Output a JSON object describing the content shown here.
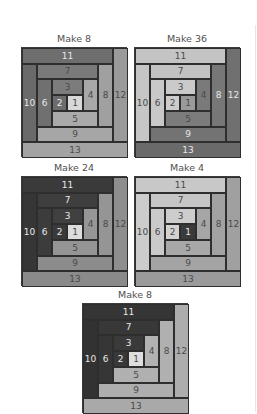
{
  "blocks": [
    {
      "id": "A",
      "title": "Make 8",
      "x": 21,
      "y": 33,
      "colors": {
        "1": "#d8d8d8",
        "2": "#6c6c6c",
        "3": "#7c7c7c",
        "4": "#a8a8a8",
        "5": "#aaaaaa",
        "6": "#707070",
        "7": "#7a7a7a",
        "8": "#a0a0a0",
        "9": "#a6a6a6",
        "10": "#6a6a6a",
        "11": "#6e6e6e",
        "12": "#9a9a9a",
        "13": "#a3a3a3"
      }
    },
    {
      "id": "B",
      "title": "Make 36",
      "x": 134,
      "y": 33,
      "colors": {
        "1": "#9a9a9a",
        "2": "#cccccc",
        "3": "#cacaca",
        "4": "#7a7a7a",
        "5": "#7c7c7c",
        "6": "#c8c8c8",
        "7": "#c2c2c2",
        "8": "#777777",
        "9": "#737373",
        "10": "#c6c6c6",
        "11": "#c4c4c4",
        "12": "#707070",
        "13": "#6a6a6a"
      }
    },
    {
      "id": "C",
      "title": "Make 24",
      "x": 21,
      "y": 162,
      "colors": {
        "1": "#dcdcdc",
        "2": "#3a3a3a",
        "3": "#404040",
        "4": "#969696",
        "5": "#959595",
        "6": "#3c3c3c",
        "7": "#3e3e3e",
        "8": "#959595",
        "9": "#8c8c8c",
        "10": "#363636",
        "11": "#3a3a3a",
        "12": "#8e8e8e",
        "13": "#8a8a8a"
      }
    },
    {
      "id": "D",
      "title": "Make 4",
      "x": 134,
      "y": 162,
      "colors": {
        "1": "#3a3a3a",
        "2": "#d2d2d2",
        "3": "#cdcdcd",
        "4": "#a6a6a6",
        "5": "#a8a8a8",
        "6": "#cacaca",
        "7": "#c6c6c6",
        "8": "#a2a2a2",
        "9": "#a4a4a4",
        "10": "#cccccc",
        "11": "#c8c8c8",
        "12": "#a0a0a0",
        "13": "#9a9a9a"
      }
    },
    {
      "id": "E",
      "title": "Make 8",
      "x": 82,
      "y": 289,
      "colors": {
        "1": "#dedede",
        "2": "#383838",
        "3": "#3a3a3a",
        "4": "#b2b2b2",
        "5": "#b0b0b0",
        "6": "#363636",
        "7": "#383838",
        "8": "#b0b0b0",
        "9": "#aeaeae",
        "10": "#323232",
        "11": "#353535",
        "12": "#adadad",
        "13": "#a9a9a9"
      }
    }
  ],
  "strip_labels": [
    "1",
    "2",
    "3",
    "4",
    "5",
    "6",
    "7",
    "8",
    "9",
    "10",
    "11",
    "12",
    "13"
  ],
  "layout_units": {
    "1": [
      3,
      3,
      1,
      1
    ],
    "2": [
      2,
      3,
      1,
      1
    ],
    "3": [
      2,
      2,
      2,
      1
    ],
    "4": [
      4,
      2,
      1,
      2
    ],
    "5": [
      2,
      4,
      3,
      1
    ],
    "6": [
      1,
      2,
      1,
      3
    ],
    "7": [
      1,
      1,
      4,
      1
    ],
    "8": [
      5,
      1,
      1,
      4
    ],
    "9": [
      1,
      5,
      5,
      1
    ],
    "10": [
      0,
      1,
      1,
      5
    ],
    "11": [
      0,
      0,
      6,
      1
    ],
    "12": [
      6,
      0,
      1,
      6
    ],
    "13": [
      0,
      6,
      7,
      1
    ]
  }
}
